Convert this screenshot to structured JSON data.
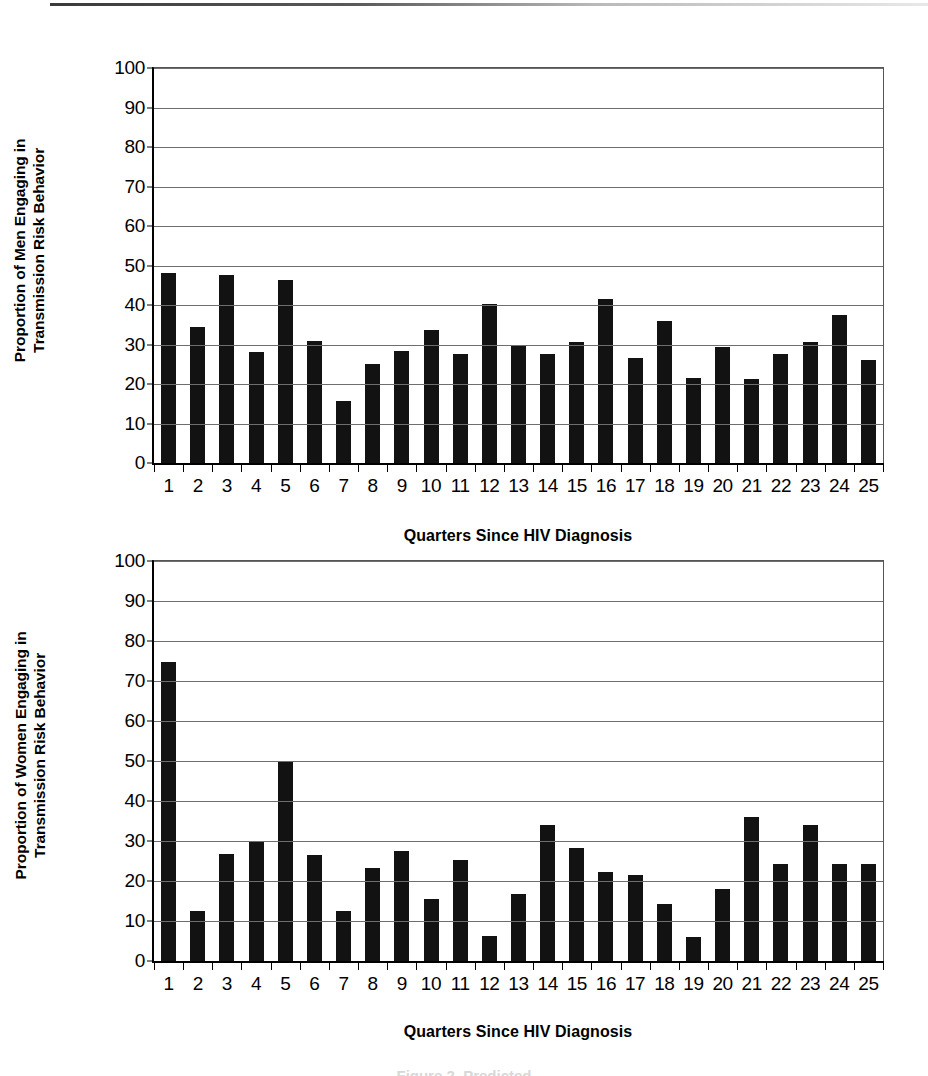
{
  "figure": {
    "caption": "Figure 2. Predicted",
    "axis_color": "#000000",
    "bar_color": "#121212",
    "gridline_color": "#6e6e6e"
  },
  "chart_data": [
    {
      "type": "bar",
      "id": "men-panel",
      "title": "",
      "xlabel": "Quarters Since HIV Diagnosis",
      "ylabel": "Proportion of Men Engaging in Transmission Risk Behavior",
      "ylabel_lines": [
        "Proportion of Men Engaging in",
        "Transmission Risk Behavior"
      ],
      "ylim": [
        0,
        100
      ],
      "yticks": [
        0,
        10,
        20,
        30,
        40,
        50,
        60,
        70,
        80,
        90,
        100
      ],
      "grid": true,
      "legend": "none",
      "categories": [
        "1",
        "2",
        "3",
        "4",
        "5",
        "6",
        "7",
        "8",
        "9",
        "10",
        "11",
        "12",
        "13",
        "14",
        "15",
        "16",
        "17",
        "18",
        "19",
        "20",
        "21",
        "22",
        "23",
        "24",
        "25"
      ],
      "values": [
        48.2,
        34.4,
        47.6,
        28.2,
        46.4,
        30.8,
        15.6,
        25.0,
        28.4,
        33.7,
        27.6,
        40.3,
        29.7,
        27.6,
        30.6,
        41.6,
        26.5,
        35.9,
        21.6,
        29.4,
        21.3,
        27.7,
        30.7,
        37.4,
        26.1
      ]
    },
    {
      "type": "bar",
      "id": "women-panel",
      "title": "",
      "xlabel": "Quarters Since HIV Diagnosis",
      "ylabel": "Proportion of Women Engaging in Transmission Risk Behavior",
      "ylabel_lines": [
        "Proportion of Women Engaging in",
        "Transmission Risk Behavior"
      ],
      "ylim": [
        0,
        100
      ],
      "yticks": [
        0,
        10,
        20,
        30,
        40,
        50,
        60,
        70,
        80,
        90,
        100
      ],
      "grid": true,
      "legend": "none",
      "categories": [
        "1",
        "2",
        "3",
        "4",
        "5",
        "6",
        "7",
        "8",
        "9",
        "10",
        "11",
        "12",
        "13",
        "14",
        "15",
        "16",
        "17",
        "18",
        "19",
        "20",
        "21",
        "22",
        "23",
        "24",
        "25"
      ],
      "values": [
        74.8,
        12.4,
        26.8,
        30.0,
        50.0,
        26.5,
        12.6,
        23.2,
        27.6,
        15.6,
        25.2,
        6.2,
        16.7,
        33.9,
        28.3,
        22.3,
        21.4,
        14.3,
        6.1,
        18.1,
        35.9,
        24.2,
        34.0,
        24.2,
        24.2
      ]
    }
  ]
}
